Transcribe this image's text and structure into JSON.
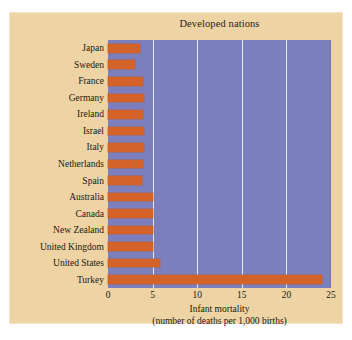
{
  "chart_data": {
    "type": "bar",
    "orientation": "horizontal",
    "title": "Developed nations",
    "xlabel_line1": "Infant mortality",
    "xlabel_line2": "(number of deaths per 1,000 births)",
    "ylabel": "",
    "xlim": [
      0,
      25
    ],
    "xticks": [
      0,
      5,
      10,
      15,
      20,
      25
    ],
    "xtick_labels": [
      "0",
      "5",
      "10",
      "15",
      "20",
      "25"
    ],
    "grid": "vertical-at-xticks",
    "legend": "none",
    "categories": [
      "Japan",
      "Sweden",
      "France",
      "Germany",
      "Ireland",
      "Israel",
      "Italy",
      "Netherlands",
      "Spain",
      "Australia",
      "Canada",
      "New Zealand",
      "United Kingdom",
      "United States",
      "Turkey"
    ],
    "values": [
      3.6,
      3.0,
      3.9,
      4.0,
      3.9,
      4.0,
      4.0,
      3.9,
      3.8,
      5.0,
      5.0,
      5.0,
      5.0,
      5.8,
      24.0
    ],
    "colors": {
      "bar": "#d4632a",
      "plot_background": "#7b7fbe",
      "figure_background": "#eed3a4",
      "gridline": "#e8e8f4",
      "text": "#211a10"
    }
  }
}
